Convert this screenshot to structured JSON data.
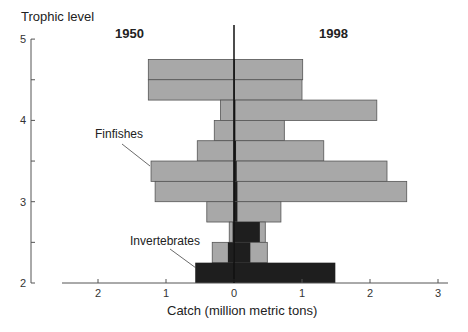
{
  "chart_data": {
    "type": "bar",
    "orientation": "horizontal-back-to-back",
    "title": "",
    "ylabel": "Trophic level",
    "xlabel": "Catch (million metric tons)",
    "ylim": [
      2,
      5
    ],
    "xlim_left": [
      0,
      2.5
    ],
    "xlim_right": [
      0,
      3
    ],
    "y_ticks": [
      "2",
      "3",
      "4",
      "5"
    ],
    "x_ticks": [
      "2",
      "1",
      "0",
      "1",
      "2",
      "3"
    ],
    "panels": [
      "1950",
      "1998"
    ],
    "annotations": [
      "Finfishes",
      "Invertebrates"
    ],
    "bins": [
      {
        "from": 4.5,
        "to": 4.75
      },
      {
        "from": 4.25,
        "to": 4.5
      },
      {
        "from": 4.0,
        "to": 4.25
      },
      {
        "from": 3.75,
        "to": 4.0
      },
      {
        "from": 3.5,
        "to": 3.75
      },
      {
        "from": 3.25,
        "to": 3.5
      },
      {
        "from": 3.0,
        "to": 3.25
      },
      {
        "from": 2.75,
        "to": 3.0
      },
      {
        "from": 2.5,
        "to": 2.75
      },
      {
        "from": 2.25,
        "to": 2.5
      },
      {
        "from": 2.0,
        "to": 2.25
      }
    ],
    "series": [
      {
        "name": "Finfishes 1950",
        "side": "left",
        "color": "#a8a8a8",
        "values": [
          1.26,
          1.26,
          0.2,
          0.29,
          0.54,
          1.22,
          1.16,
          0.4,
          0.07,
          0.32,
          0.0
        ]
      },
      {
        "name": "Invertebrates 1950",
        "side": "left",
        "color": "#1e1e1e",
        "values": [
          0,
          0,
          0,
          0,
          0,
          0,
          0,
          0,
          0.02,
          0.09,
          0.57
        ]
      },
      {
        "name": "Finfishes 1998",
        "side": "right",
        "color": "#a8a8a8",
        "values": [
          1.01,
          1.0,
          2.1,
          0.74,
          1.32,
          2.25,
          2.54,
          0.69,
          0.46,
          0.49,
          0.0
        ]
      },
      {
        "name": "Invertebrates 1998",
        "side": "right",
        "color": "#1e1e1e",
        "values": [
          0.01,
          0.01,
          0.02,
          0.02,
          0.03,
          0.04,
          0.05,
          0.05,
          0.38,
          0.24,
          1.49
        ]
      }
    ]
  },
  "labels": {
    "ylabel": "Trophic level",
    "xlabel": "Catch (million metric tons)",
    "year_left": "1950",
    "year_right": "1998",
    "finfishes": "Finfishes",
    "invertebrates": "Invertebrates"
  },
  "colors": {
    "finfish": "#a8a8a8",
    "invertebrate": "#1e1e1e",
    "axis": "#555555"
  }
}
